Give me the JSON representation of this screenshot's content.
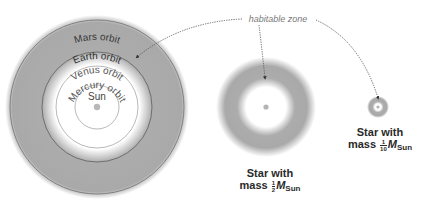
{
  "diagram": {
    "colors": {
      "zone_gray": "#a9a9a9",
      "orbit_line": "#6a6a6a",
      "inner_orbit_line": "#8a8a8a",
      "star_dot": "#b4b4b4",
      "text": "#3a3a3a",
      "label_text": "#7a7a7a",
      "arrow": "#555555"
    },
    "annotation": {
      "label": "habitable zone"
    },
    "solar_system": {
      "star_label": "Sun",
      "orbits": [
        {
          "name": "Mercury orbit",
          "label": "Mercury orbit"
        },
        {
          "name": "Venus orbit",
          "label": "Venus orbit"
        },
        {
          "name": "Earth orbit",
          "label": "Earth orbit"
        },
        {
          "name": "Mars orbit",
          "label": "Mars orbit"
        }
      ]
    },
    "stars": [
      {
        "name": "half-solar-mass-star",
        "line1": "Star with",
        "line2_prefix": "mass",
        "fraction_num": "1",
        "fraction_den": "2",
        "symbol": "M",
        "subscript": "Sun"
      },
      {
        "name": "tenth-solar-mass-star",
        "line1": "Star with",
        "line2_prefix": "mass",
        "fraction_num": "1",
        "fraction_den": "10",
        "symbol": "M",
        "subscript": "Sun"
      }
    ]
  }
}
